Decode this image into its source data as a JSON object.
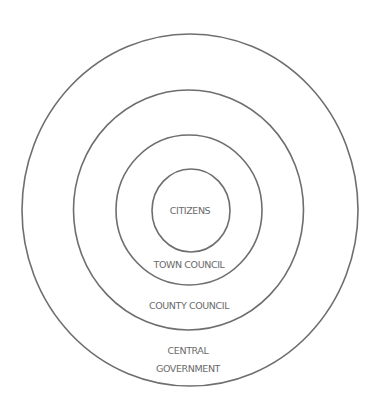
{
  "diagram": {
    "type": "concentric-circles",
    "rings": [
      {
        "id": "central-government",
        "label_lines": [
          "CENTRAL",
          "GOVERNMENT"
        ],
        "fill": "stipple-light"
      },
      {
        "id": "county-council",
        "label": "COUNTY COUNCIL",
        "fill": "white"
      },
      {
        "id": "town-council",
        "label": "TOWN COUNCIL",
        "fill": "horizontal-hatch-gray"
      },
      {
        "id": "citizens",
        "label": "CITIZENS",
        "fill": "stipple-light"
      }
    ],
    "labels": {
      "citizens": "CITIZENS",
      "town_council": "TOWN COUNCIL",
      "county_council": "COUNTY COUNCIL",
      "central_line1": "CENTRAL",
      "central_line2": "GOVERNMENT"
    },
    "colors": {
      "stroke": "#6e6e6e",
      "text": "#6a6a6a",
      "stipple": "#f3f3f3",
      "hatch_bg": "#e6e6e6",
      "hatch_line": "#c4c4c4"
    }
  }
}
